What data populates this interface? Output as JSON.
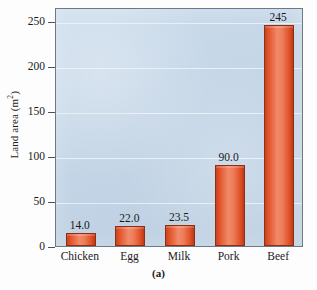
{
  "chart_data": {
    "type": "bar",
    "title": "",
    "xlabel": "",
    "ylabel": "Land area (m2)",
    "ylabel_base": "Land area (m",
    "ylabel_sup": "2",
    "ylabel_close": ")",
    "categories": [
      "Chicken",
      "Egg",
      "Milk",
      "Pork",
      "Beef"
    ],
    "values": [
      14.0,
      22.0,
      23.5,
      90.0,
      245
    ],
    "value_labels": [
      "14.0",
      "22.0",
      "23.5",
      "90.0",
      "245"
    ],
    "ylim": [
      0,
      265
    ],
    "yticks": [
      0,
      50,
      100,
      150,
      200,
      250
    ],
    "ytick_labels": [
      "0",
      "50",
      "100",
      "150",
      "200",
      "250"
    ],
    "grid": true,
    "grid_axis": "y",
    "legend": "none",
    "panel_label": "(a)"
  },
  "style": {
    "plot_background": "#c2d5e8",
    "bar_color": "#e2562c",
    "bar_edge_color": "#8e2f14",
    "gridline_color": "#edf3f8",
    "frame_color": "#6c7a86",
    "text_color": "#1a1a1a",
    "page_background": "#fdfdfd"
  }
}
